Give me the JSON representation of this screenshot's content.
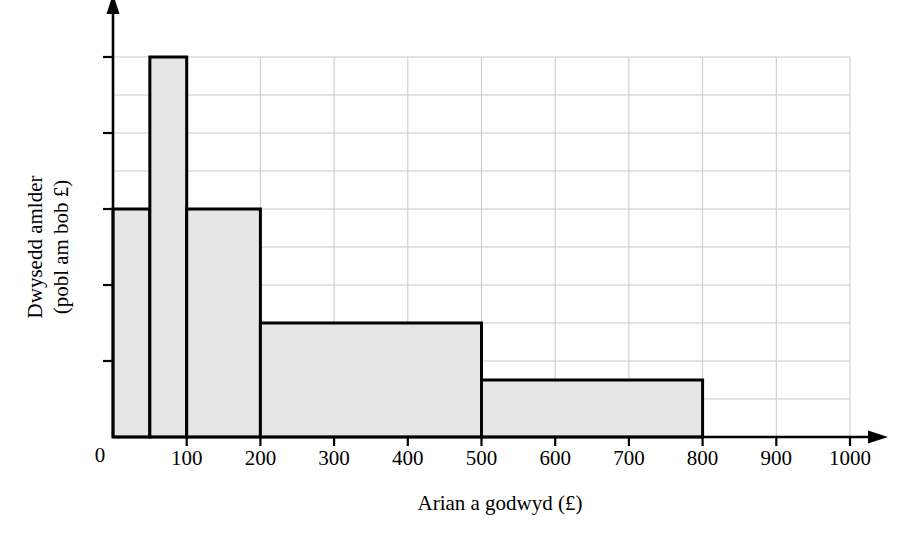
{
  "chart_data": {
    "type": "bar",
    "title": "",
    "subtitle": "",
    "xlabel": "Arian a godwyd (£)",
    "ylabel_line1": "Dwysedd amlder",
    "ylabel_line2": "(pobl am bob £)",
    "ylabel": "Dwysedd amlder (pobl am bob £)",
    "xlim": [
      0,
      1000
    ],
    "ylim": [
      0,
      10
    ],
    "grid": true,
    "grid_x_max": 1000,
    "grid_y_max": 10,
    "y_axis_labeled": false,
    "y_origin_label": "0",
    "legend": "none",
    "x_tick_labels": [
      "100",
      "200",
      "300",
      "400",
      "500",
      "600",
      "700",
      "800",
      "900",
      "1000"
    ],
    "x_tick_values": [
      100,
      200,
      300,
      400,
      500,
      600,
      700,
      800,
      900,
      1000
    ],
    "x_gridline_values": [
      100,
      200,
      300,
      400,
      500,
      600,
      700,
      800,
      900,
      1000
    ],
    "y_gridline_values": [
      1,
      2,
      3,
      4,
      5,
      6,
      7,
      8,
      9,
      10
    ],
    "y_tickmark_values": [
      2,
      4,
      6,
      8,
      10
    ],
    "bars": [
      {
        "x_start": 0,
        "x_end": 50,
        "height": 6.0
      },
      {
        "x_start": 50,
        "x_end": 100,
        "height": 10.0
      },
      {
        "x_start": 100,
        "x_end": 200,
        "height": 6.0
      },
      {
        "x_start": 200,
        "x_end": 500,
        "height": 3.0
      },
      {
        "x_start": 500,
        "x_end": 800,
        "height": 1.5
      }
    ],
    "colors": {
      "bar_fill": "#e6e6e6",
      "bar_stroke": "#000000",
      "gridline": "#c9c9c9",
      "axis": "#000000",
      "background": "#ffffff"
    }
  }
}
